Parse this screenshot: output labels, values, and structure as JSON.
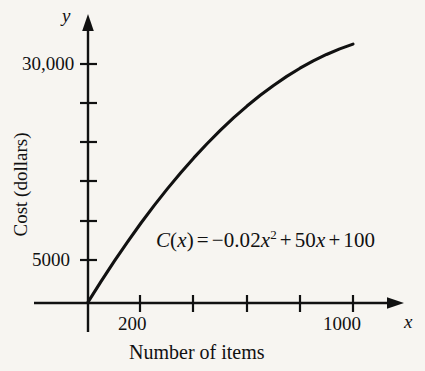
{
  "figure": {
    "background_color": "#f7f5f1",
    "ink_color": "#111111"
  },
  "axes": {
    "y_variable": "y",
    "x_variable": "x",
    "y_axis_title": "Cost (dollars)",
    "x_axis_title": "Number of items"
  },
  "annotations": {
    "equation": {
      "function_name": "C",
      "open_paren": "(",
      "arg": "x",
      "close_paren": ")",
      "equals": "=",
      "minus": "−",
      "coef_quadratic": "0.02",
      "var_quadratic": "x",
      "exponent": "2",
      "plus_1": "+",
      "coef_linear": "50",
      "var_linear": "x",
      "plus_2": "+",
      "constant": "100",
      "full_text": "C(x) = −0.02x² + 50x + 100"
    }
  },
  "chart_data": {
    "type": "line",
    "title": "",
    "subtitle": "",
    "xlabel": "Number of items",
    "ylabel": "Cost (dollars)",
    "xlim": [
      0,
      1120
    ],
    "ylim": [
      0,
      33000
    ],
    "grid": false,
    "legend": null,
    "equation": "C(x) = -0.02x^2 + 50x + 100",
    "x_tick_values": [
      200,
      400,
      600,
      800,
      1000
    ],
    "x_tick_labels": [
      "200",
      "",
      "",
      "",
      "1000"
    ],
    "y_tick_values": [
      5000,
      10000,
      15000,
      20000,
      25000,
      30000
    ],
    "y_tick_labels": [
      "5000",
      "",
      "",
      "",
      "",
      "30,000"
    ],
    "series": [
      {
        "name": "C(x)",
        "x": [
          0,
          50,
          100,
          150,
          200,
          250,
          300,
          350,
          400,
          450,
          500,
          550,
          600,
          650,
          700,
          750,
          800,
          850,
          900,
          950,
          1000
        ],
        "y": [
          100,
          2550,
          4900,
          7150,
          9300,
          11350,
          13300,
          15150,
          16900,
          18550,
          20100,
          21550,
          22900,
          24150,
          25300,
          26350,
          27300,
          28150,
          28900,
          29550,
          30100
        ]
      }
    ]
  }
}
